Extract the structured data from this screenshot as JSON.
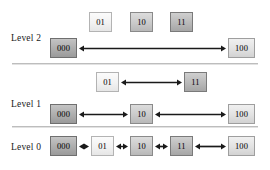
{
  "diagram": {
    "type": "hierarchical-level-diagram",
    "title": "",
    "ink_color": "#1a1a1a",
    "divider_color": "#bdbdbd",
    "levels": [
      {
        "id": "level-2",
        "label": "Level 2",
        "label_x": 11,
        "label_y": 33,
        "inactive_nodes": [
          {
            "label": "01",
            "x": 89,
            "y": 12,
            "shade": "sh-white"
          },
          {
            "label": "10",
            "x": 130,
            "y": 12,
            "shade": "sh-mid"
          },
          {
            "label": "11",
            "x": 170,
            "y": 12,
            "shade": "sh-dark"
          }
        ],
        "active_nodes": [
          {
            "label": "000",
            "x": 50,
            "y": 38,
            "shade": "sh-darker",
            "wide": true
          },
          {
            "label": "100",
            "x": 228,
            "y": 38,
            "shade": "sh-light",
            "wide": true
          }
        ],
        "arrows": [
          {
            "x1": 79,
            "x2": 226,
            "y": 48,
            "heads": "both"
          }
        ]
      },
      {
        "id": "level-1",
        "label": "Level 1",
        "label_x": 11,
        "label_y": 99,
        "inactive_nodes": [
          {
            "label": "01",
            "x": 96,
            "y": 72,
            "shade": "sh-white"
          },
          {
            "label": "11",
            "x": 184,
            "y": 72,
            "shade": "sh-dark"
          }
        ],
        "active_nodes": [
          {
            "label": "000",
            "x": 50,
            "y": 104,
            "shade": "sh-darker",
            "wide": true
          },
          {
            "label": "10",
            "x": 130,
            "y": 104,
            "shade": "sh-mid"
          },
          {
            "label": "100",
            "x": 228,
            "y": 104,
            "shade": "sh-light",
            "wide": true
          }
        ],
        "arrows": [
          {
            "x1": 121,
            "x2": 182,
            "y": 82,
            "heads": "both"
          },
          {
            "x1": 79,
            "x2": 128,
            "y": 114,
            "heads": "both"
          },
          {
            "x1": 155,
            "x2": 226,
            "y": 114,
            "heads": "both"
          }
        ]
      },
      {
        "id": "level-0",
        "label": "Level 0",
        "label_x": 11,
        "label_y": 142,
        "inactive_nodes": [],
        "active_nodes": [
          {
            "label": "000",
            "x": 50,
            "y": 136,
            "shade": "sh-darker",
            "wide": true
          },
          {
            "label": "01",
            "x": 91,
            "y": 136,
            "shade": "sh-white"
          },
          {
            "label": "10",
            "x": 130,
            "y": 136,
            "shade": "sh-mid"
          },
          {
            "label": "11",
            "x": 170,
            "y": 136,
            "shade": "sh-dark"
          },
          {
            "label": "100",
            "x": 228,
            "y": 136,
            "shade": "sh-light",
            "wide": true
          }
        ],
        "arrows": [
          {
            "x1": 79,
            "x2": 89,
            "y": 146,
            "heads": "both"
          },
          {
            "x1": 116,
            "x2": 128,
            "y": 146,
            "heads": "both"
          },
          {
            "x1": 155,
            "x2": 168,
            "y": 146,
            "heads": "both"
          },
          {
            "x1": 195,
            "x2": 226,
            "y": 146,
            "heads": "both"
          }
        ]
      }
    ],
    "dividers": [
      {
        "x": 12,
        "y": 63,
        "width": 246
      },
      {
        "x": 12,
        "y": 126,
        "width": 246
      }
    ]
  }
}
